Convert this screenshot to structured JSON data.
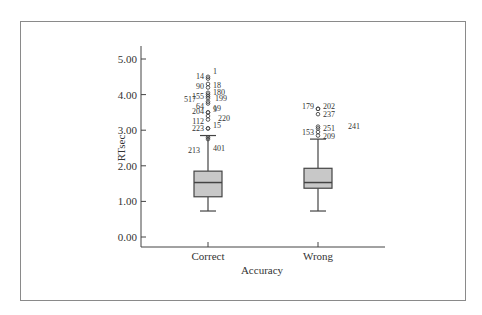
{
  "chart_data": {
    "type": "boxplot",
    "title": "",
    "xlabel": "Accuracy",
    "ylabel": "RTsec",
    "ylim": [
      0,
      5
    ],
    "yticks": [
      "0.00",
      "1.00",
      "2.00",
      "3.00",
      "4.00",
      "5.00"
    ],
    "categories": [
      "Correct",
      "Wrong"
    ],
    "grid": false,
    "boxes": [
      {
        "category": "Correct",
        "whisker_low": 0.73,
        "q1": 1.13,
        "median": 1.53,
        "q3": 1.85,
        "whisker_high": 2.85,
        "outliers": [
          {
            "id": "1",
            "value": 4.5
          },
          {
            "id": "14",
            "value": 4.45
          },
          {
            "id": "18",
            "value": 4.3
          },
          {
            "id": "90",
            "value": 4.2
          },
          {
            "id": "180",
            "value": 4.05
          },
          {
            "id": "155",
            "value": 4.0
          },
          {
            "id": "199",
            "value": 3.95
          },
          {
            "id": "517",
            "value": 3.9
          },
          {
            "id": "64",
            "value": 3.8
          },
          {
            "id": "19",
            "value": 3.75
          },
          {
            "id": "204",
            "value": 3.5
          },
          {
            "id": "9",
            "value": 3.5
          },
          {
            "id": "220",
            "value": 3.4
          },
          {
            "id": "112",
            "value": 3.3
          },
          {
            "id": "223",
            "value": 3.05
          },
          {
            "id": "15",
            "value": 3.05
          },
          {
            "id": "213",
            "value": 2.75
          },
          {
            "id": "401",
            "value": 2.8
          }
        ]
      },
      {
        "category": "Wrong",
        "whisker_low": 0.73,
        "q1": 1.37,
        "median": 1.53,
        "q3": 1.93,
        "whisker_high": 2.75,
        "outliers": [
          {
            "id": "179",
            "value": 3.6
          },
          {
            "id": "202",
            "value": 3.6
          },
          {
            "id": "237",
            "value": 3.45
          },
          {
            "id": "241",
            "value": 3.1
          },
          {
            "id": "251",
            "value": 3.05
          },
          {
            "id": "153",
            "value": 2.95
          },
          {
            "id": "209",
            "value": 2.85
          }
        ]
      }
    ]
  },
  "colors": {
    "box_fill": "#c8c8c8",
    "stroke": "#444444",
    "frame": "#8a8a8a"
  }
}
